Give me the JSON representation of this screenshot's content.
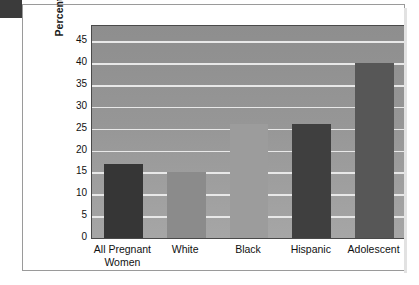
{
  "chart_data": {
    "type": "bar",
    "title": "",
    "xlabel": "",
    "ylabel": "Percentage with Late or No Prenatal Care",
    "categories": [
      "All Pregnant Women",
      "White",
      "Black",
      "Hispanic",
      "Adolescent"
    ],
    "values": [
      17,
      15,
      26,
      26,
      40
    ],
    "ylim": [
      0,
      48.5
    ],
    "yticks": [
      0,
      5,
      10,
      15,
      20,
      25,
      30,
      35,
      40,
      45
    ],
    "ytick_labels": [
      "0",
      "5",
      "10",
      "15",
      "20",
      "25",
      "30",
      "35",
      "40",
      "45"
    ],
    "grid": true,
    "legend": "none",
    "bar_colors": [
      "#363636",
      "#8b8b8b",
      "#9c9c9c",
      "#3f3f3f",
      "#575757"
    ],
    "plot_background": "#979797",
    "gridline_color": "#e8e8e8",
    "axis_color": "#4a4a4a",
    "frame_color": "#9a9a9a",
    "label_color": "#111111"
  },
  "figure": {
    "category_lines": [
      [
        "All Pregnant",
        "Women"
      ],
      [
        "White"
      ],
      [
        "Black"
      ],
      [
        "Hispanic"
      ],
      [
        "Adolescent"
      ]
    ]
  }
}
